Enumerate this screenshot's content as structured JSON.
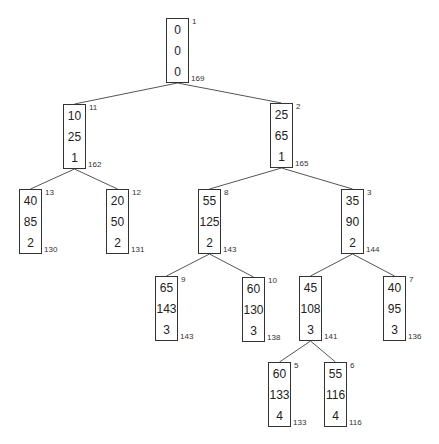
{
  "diagram": {
    "type": "tree",
    "nodes": [
      {
        "id": "n1",
        "order": "1",
        "values": [
          "0",
          "0",
          "0"
        ],
        "bound": "169",
        "x": 166,
        "y": 18
      },
      {
        "id": "n11",
        "order": "11",
        "values": [
          "10",
          "25",
          "1"
        ],
        "bound": "162",
        "x": 63,
        "y": 104
      },
      {
        "id": "n2",
        "order": "2",
        "values": [
          "25",
          "65",
          "1"
        ],
        "bound": "165",
        "x": 270,
        "y": 103
      },
      {
        "id": "n13",
        "order": "13",
        "values": [
          "40",
          "85",
          "2"
        ],
        "bound": "130",
        "x": 19,
        "y": 189
      },
      {
        "id": "n12",
        "order": "12",
        "values": [
          "20",
          "50",
          "2"
        ],
        "bound": "131",
        "x": 106,
        "y": 189
      },
      {
        "id": "n8",
        "order": "8",
        "values": [
          "55",
          "125",
          "2"
        ],
        "bound": "143",
        "x": 198,
        "y": 189
      },
      {
        "id": "n3",
        "order": "3",
        "values": [
          "35",
          "90",
          "2"
        ],
        "bound": "144",
        "x": 341,
        "y": 189
      },
      {
        "id": "n9",
        "order": "9",
        "values": [
          "65",
          "143",
          "3"
        ],
        "bound": "143",
        "x": 155,
        "y": 276
      },
      {
        "id": "n10",
        "order": "10",
        "values": [
          "60",
          "130",
          "3"
        ],
        "bound": "138",
        "x": 242,
        "y": 277
      },
      {
        "id": "n4",
        "order": "",
        "values": [
          "45",
          "108",
          "3"
        ],
        "bound": "141",
        "x": 299,
        "y": 276
      },
      {
        "id": "n7",
        "order": "7",
        "values": [
          "40",
          "95",
          "3"
        ],
        "bound": "136",
        "x": 383,
        "y": 276
      },
      {
        "id": "n5",
        "order": "5",
        "values": [
          "60",
          "133",
          "4"
        ],
        "bound": "133",
        "x": 268,
        "y": 362
      },
      {
        "id": "n6",
        "order": "6",
        "values": [
          "55",
          "116",
          "4"
        ],
        "bound": "116",
        "x": 324,
        "y": 362
      }
    ],
    "edges": [
      [
        "n1",
        "n11"
      ],
      [
        "n1",
        "n2"
      ],
      [
        "n11",
        "n13"
      ],
      [
        "n11",
        "n12"
      ],
      [
        "n2",
        "n8"
      ],
      [
        "n2",
        "n3"
      ],
      [
        "n8",
        "n9"
      ],
      [
        "n8",
        "n10"
      ],
      [
        "n3",
        "n4"
      ],
      [
        "n3",
        "n7"
      ],
      [
        "n4",
        "n5"
      ],
      [
        "n4",
        "n6"
      ]
    ],
    "colors": {
      "line": "#555555",
      "border": "#333333",
      "text": "#222222"
    }
  }
}
